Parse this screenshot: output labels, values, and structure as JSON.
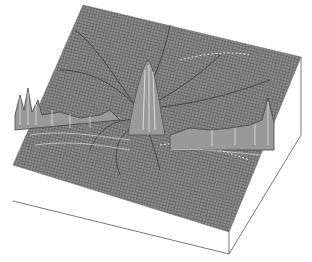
{
  "figure": {
    "surface_color": "#7a7a7a",
    "mesh_line_color": "#4a4a4a",
    "highlight_color": "#e0e0e0",
    "box_fill": "#ffffff",
    "box_edge_color": "#555555",
    "corners": {
      "top": [
        83,
        5
      ],
      "right": [
        301,
        57
      ],
      "front": [
        229,
        254
      ],
      "left": [
        13,
        165
      ],
      "left_bottom": [
        13,
        201
      ],
      "right_bottom": [
        301,
        135
      ],
      "front_bottom": [
        229,
        262
      ]
    }
  }
}
